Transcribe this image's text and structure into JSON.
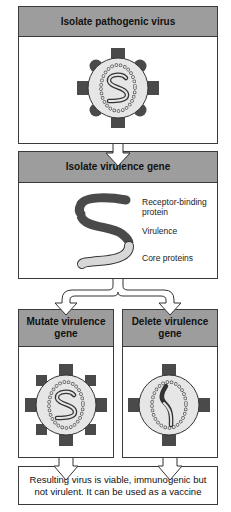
{
  "steps": {
    "step1": {
      "title": "Isolate pathogenic virus"
    },
    "step2": {
      "title": "Isolate virulence gene",
      "gene_segments": [
        {
          "label_line1": "Receptor-binding",
          "label_line2": "protein",
          "color": "#4a4a4a"
        },
        {
          "label": "Virulence",
          "color": "#4a4a4a"
        },
        {
          "label": "Core proteins",
          "color": "#d8d8d8"
        }
      ]
    },
    "step3a": {
      "title": "Mutate virulence gene"
    },
    "step3b": {
      "title": "Delete virulence gene"
    },
    "result": {
      "text": "Resulting virus is viable, immunogenic but not virulent. It can be used as a vaccine"
    }
  },
  "colors": {
    "header_fill": "#9d9d9d",
    "dark_protein": "#4a4a4a",
    "light_fill": "#e6e6e6",
    "border": "#3a3a3a"
  }
}
